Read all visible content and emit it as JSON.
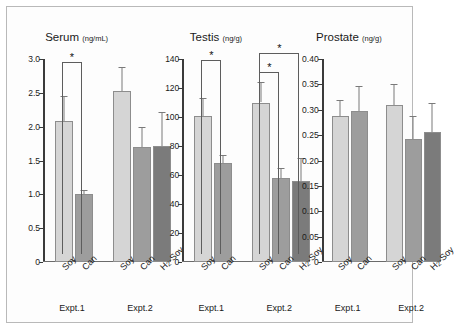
{
  "figure": {
    "panels": [
      "serum",
      "testis",
      "prostate"
    ],
    "group_labels": [
      "Expt.1",
      "Expt.2"
    ],
    "colors": {
      "bar_light": "#d5d5d5",
      "bar_mid": "#9d9d9d",
      "bar_dark": "#7b7b7b",
      "axis": "#3a3a3a",
      "error_bar": "#7a7a7a",
      "frame": "#b9b9b9"
    },
    "significance_symbol": "*"
  },
  "chart_data": [
    {
      "type": "bar",
      "title": "Serum",
      "unit": "(ng/mL)",
      "xlabel": "",
      "ylabel": "",
      "ylim": [
        0,
        3.0
      ],
      "yticks": [
        "0",
        "0.5",
        "1.0",
        "1.5",
        "2.0",
        "2.5",
        "3.0"
      ],
      "ytick_values": [
        0,
        0.5,
        1.0,
        1.5,
        2.0,
        2.5,
        3.0
      ],
      "grid": false,
      "legend": "none",
      "groups": [
        {
          "name": "Expt.1",
          "categories": [
            "Soy",
            "Can"
          ],
          "values": [
            2.08,
            1.01
          ],
          "errors": [
            0.37,
            0.05
          ]
        },
        {
          "name": "Expt.2",
          "categories": [
            "Soy",
            "Can",
            "H2-Soy"
          ],
          "values": [
            2.53,
            1.7,
            1.72
          ],
          "errors": [
            0.35,
            0.29,
            0.5
          ]
        }
      ],
      "annotations": [
        {
          "group": "Expt.1",
          "from": "Soy",
          "to": "Can",
          "symbol": "*",
          "y": 2.96
        }
      ]
    },
    {
      "type": "bar",
      "title": "Testis",
      "unit": "(ng/g)",
      "xlabel": "",
      "ylabel": "",
      "ylim": [
        0,
        140
      ],
      "yticks": [
        "0",
        "20",
        "40",
        "60",
        "80",
        "100",
        "120",
        "140"
      ],
      "ytick_values": [
        0,
        20,
        40,
        60,
        80,
        100,
        120,
        140
      ],
      "grid": false,
      "legend": "none",
      "groups": [
        {
          "name": "Expt.1",
          "categories": [
            "Soy",
            "Can"
          ],
          "values": [
            101,
            68
          ],
          "errors": [
            12,
            6
          ]
        },
        {
          "name": "Expt.2",
          "categories": [
            "Soy",
            "Can",
            "H2-Soy"
          ],
          "values": [
            110,
            58,
            56
          ],
          "errors": [
            14,
            7,
            16
          ]
        }
      ],
      "annotations": [
        {
          "group": "Expt.1",
          "from": "Soy",
          "to": "Can",
          "symbol": "*",
          "y": 139
        },
        {
          "group": "Expt.2",
          "from": "Soy",
          "to": "Can",
          "symbol": "*",
          "y": 131
        },
        {
          "group": "Expt.2",
          "from": "Soy",
          "to": "H2-Soy",
          "symbol": "*",
          "y": 144
        }
      ]
    },
    {
      "type": "bar",
      "title": "Prostate",
      "unit": "(ng/g)",
      "xlabel": "",
      "ylabel": "",
      "ylim": [
        0,
        0.4
      ],
      "yticks": [
        "0",
        "0.05",
        "0.10",
        "0.15",
        "0.20",
        "0.25",
        "0.30",
        "0.35",
        "0.40"
      ],
      "ytick_values": [
        0,
        0.05,
        0.1,
        0.15,
        0.2,
        0.25,
        0.3,
        0.35,
        0.4
      ],
      "grid": false,
      "legend": "none",
      "groups": [
        {
          "name": "Expt.1",
          "categories": [
            "Soy",
            "Can"
          ],
          "values": [
            0.287,
            0.297
          ],
          "errors": [
            0.032,
            0.05
          ]
        },
        {
          "name": "Expt.2",
          "categories": [
            "Soy",
            "Can",
            "H2-Soy"
          ],
          "values": [
            0.31,
            0.242,
            0.256
          ],
          "errors": [
            0.04,
            0.045,
            0.058
          ]
        }
      ],
      "annotations": []
    }
  ]
}
